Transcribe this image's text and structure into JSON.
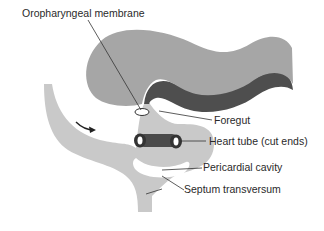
{
  "figure": {
    "colors": {
      "background": "#ffffff",
      "neural_tissue": "#a6a6a6",
      "endoderm_band": "#4e4e4e",
      "mesoderm": "#c9c9c9",
      "heart_tube": "#4a4a4a",
      "leader_line": "#333333",
      "label_text": "#2a2a2a"
    },
    "labels": [
      {
        "id": "oropharyngeal_membrane",
        "text": "Oropharyngeal membrane"
      },
      {
        "id": "foregut",
        "text": "Foregut"
      },
      {
        "id": "heart_tube",
        "text": "Heart tube (cut ends)"
      },
      {
        "id": "pericardial_cavity",
        "text": "Pericardial cavity"
      },
      {
        "id": "septum_transversum",
        "text": "Septum transversum"
      }
    ],
    "annotations": {
      "arrow": "folding-direction-arrow"
    }
  }
}
